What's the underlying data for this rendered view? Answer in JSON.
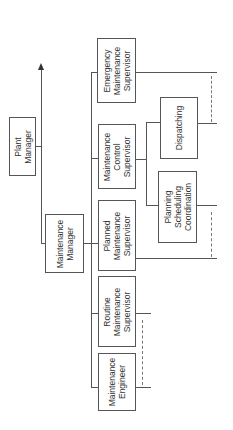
{
  "diagram": {
    "type": "org-chart",
    "orientation": "rotated-90-ccw",
    "nodes": [
      {
        "id": "plant_manager",
        "label": "Plant\nManager"
      },
      {
        "id": "maintenance_manager",
        "label": "Maintenance\nManager"
      },
      {
        "id": "emergency_supervisor",
        "label": "Emergency\nMaintenance\nSupervisor"
      },
      {
        "id": "control_supervisor",
        "label": "Maintenance\nControl\nSupervisor"
      },
      {
        "id": "planned_supervisor",
        "label": "Planned\nMaintenance\nSupervisor"
      },
      {
        "id": "routine_supervisor",
        "label": "Routine\nMaintenance\nSupervisor"
      },
      {
        "id": "engineer",
        "label": "Maintenance\nEngineer"
      },
      {
        "id": "dispatching",
        "label": "Dispatching"
      },
      {
        "id": "planning",
        "label": "Planning\nScheduling\nCoordination"
      }
    ],
    "edges": [
      {
        "from": "plant_manager",
        "to": "maintenance_manager"
      },
      {
        "from": "maintenance_manager",
        "to": "emergency_supervisor"
      },
      {
        "from": "maintenance_manager",
        "to": "control_supervisor"
      },
      {
        "from": "maintenance_manager",
        "to": "planned_supervisor"
      },
      {
        "from": "maintenance_manager",
        "to": "routine_supervisor"
      },
      {
        "from": "maintenance_manager",
        "to": "engineer"
      },
      {
        "from": "control_supervisor",
        "to": "dispatching"
      },
      {
        "from": "control_supervisor",
        "to": "planning"
      }
    ],
    "dashed_links": [
      {
        "between": [
          "emergency_supervisor",
          "dispatching"
        ]
      },
      {
        "between": [
          "planning",
          "planned_supervisor"
        ]
      },
      {
        "between": [
          "routine_supervisor",
          "engineer"
        ]
      }
    ],
    "colors": {
      "line": "#555555",
      "text": "#333333",
      "background": "#ffffff"
    }
  }
}
